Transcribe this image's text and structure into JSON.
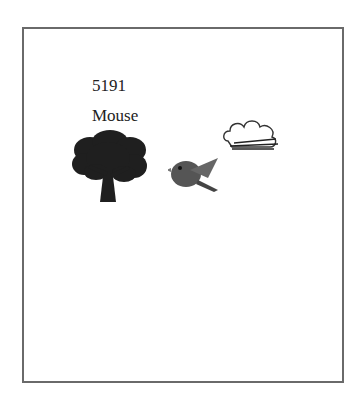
{
  "card": {
    "number": "5191",
    "word": "Mouse",
    "images": [
      {
        "name": "tree-icon",
        "description": "dark silhouette of a leafy tree"
      },
      {
        "name": "bird-icon",
        "description": "cartoon bird flying"
      },
      {
        "name": "cloud-icon",
        "description": "cloud with wind streaks"
      }
    ]
  },
  "colors": {
    "border": "#6a6a6a",
    "background": "#ffffff",
    "text": "#222222"
  }
}
